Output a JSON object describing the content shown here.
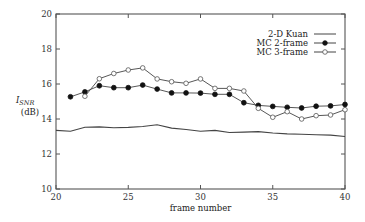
{
  "chart_data": {
    "type": "line",
    "title": "",
    "xlabel": "frame number",
    "ylabel": "I_SNR (dB)",
    "ylabel_main": "I",
    "ylabel_sub": "SNR",
    "ylabel_unit": "(dB)",
    "xlim": [
      20,
      40
    ],
    "ylim": [
      10,
      20
    ],
    "grid": false,
    "legend_position": "upper right (inside)",
    "x_ticks": [
      20,
      25,
      30,
      35,
      40
    ],
    "y_ticks": [
      10,
      12,
      14,
      16,
      18,
      20
    ],
    "x_tick_labels": [
      "20",
      "25",
      "30",
      "35",
      "40"
    ],
    "y_tick_labels": [
      "10",
      "12",
      "14",
      "16",
      "18",
      "20"
    ],
    "series": [
      {
        "name": "2-D Kuan",
        "marker": "none",
        "x": [
          20,
          21,
          22,
          23,
          24,
          25,
          26,
          27,
          28,
          29,
          30,
          31,
          32,
          33,
          34,
          35,
          36,
          37,
          38,
          39,
          40
        ],
        "values": [
          13.35,
          13.3,
          13.53,
          13.55,
          13.5,
          13.52,
          13.57,
          13.67,
          13.48,
          13.4,
          13.3,
          13.35,
          13.23,
          13.25,
          13.28,
          13.2,
          13.15,
          13.13,
          13.1,
          13.08,
          13.0
        ]
      },
      {
        "name": "MC 2-frame",
        "marker": "filled-circle",
        "x": [
          21,
          22,
          23,
          24,
          25,
          26,
          27,
          28,
          29,
          30,
          31,
          32,
          33,
          34,
          35,
          36,
          37,
          38,
          39,
          40
        ],
        "values": [
          15.27,
          15.55,
          15.9,
          15.79,
          15.79,
          15.94,
          15.71,
          15.49,
          15.49,
          15.48,
          15.41,
          15.41,
          14.93,
          14.78,
          14.72,
          14.67,
          14.63,
          14.73,
          14.75,
          14.83
        ]
      },
      {
        "name": "MC 3-frame",
        "marker": "open-circle",
        "x": [
          22,
          23,
          24,
          25,
          26,
          27,
          28,
          29,
          30,
          31,
          32,
          33,
          34,
          35,
          36,
          37,
          38,
          39,
          40
        ],
        "values": [
          15.3,
          16.3,
          16.6,
          16.8,
          16.92,
          16.29,
          16.13,
          16.04,
          16.29,
          15.75,
          15.75,
          15.6,
          14.61,
          14.1,
          14.42,
          14.0,
          14.19,
          14.23,
          14.53
        ]
      }
    ]
  }
}
